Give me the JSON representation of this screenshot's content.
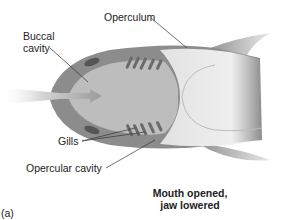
{
  "figure": {
    "panel_label": "(a)",
    "caption_line1": "Mouth opened,",
    "caption_line2": "jaw lowered",
    "labels": {
      "operculum": "Operculum",
      "buccal_line1": "Buccal",
      "buccal_line2": "cavity",
      "gills": "Gills",
      "opercular_cavity": "Opercular cavity"
    },
    "colors": {
      "body_outer": "#8c8c8c",
      "body_inner": "#bdbdbd",
      "rear_body": "#dcdcdc",
      "gill_slit": "#6a6a6a",
      "water_flow": "#c8c8c8",
      "leader_line": "#333333"
    }
  }
}
